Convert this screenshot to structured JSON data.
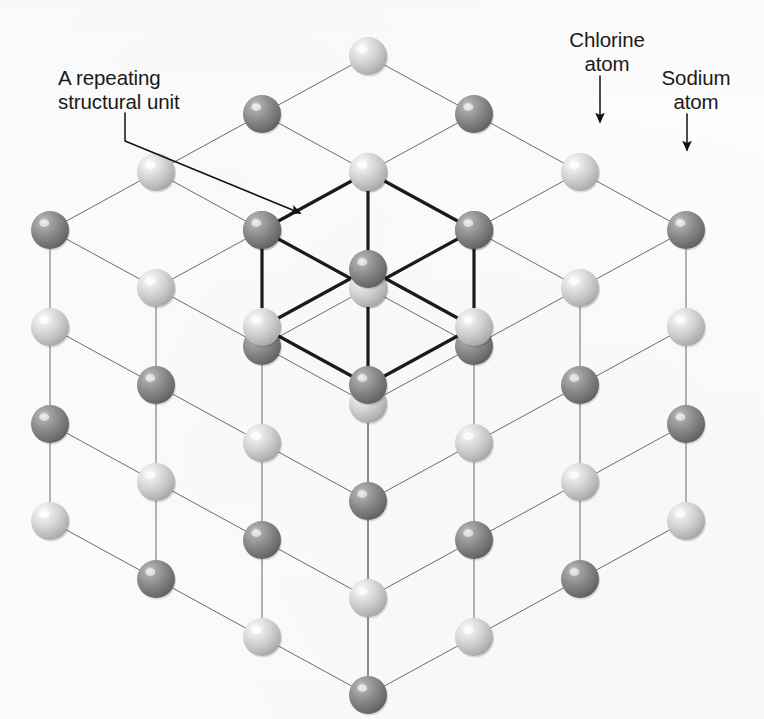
{
  "figure": {
    "background_color": "#fcfcfc"
  },
  "labels": {
    "repeating_unit": "A repeating\nstructural unit",
    "chlorine": "Chlorine\natom",
    "sodium": "Sodium\natom"
  },
  "legend": {
    "chlorine_color": "#c9c9c9",
    "sodium_color": "#7d7d7d",
    "lattice_line_color": "#6b6b6b",
    "unit_cell_line_color": "#1a1a1a",
    "text_color": "#1a1a1a"
  },
  "structure": {
    "type": "face-centered cubic rock-salt lattice",
    "grid_dimensions": "3 x 3 x 3",
    "atoms_per_edge": 4,
    "sphere_radius_px": 19,
    "atom_types": [
      "chlorine",
      "sodium"
    ],
    "alternation": "checkerboard",
    "projection": "isometric",
    "origin_px": [
      368,
      56
    ],
    "axis_u_px": [
      106,
      58
    ],
    "axis_v_px": [
      -106,
      58
    ],
    "axis_w_px": [
      0,
      97
    ],
    "highlighted_unit_cell": {
      "origin_cell": [
        1,
        1,
        0
      ],
      "size": 1,
      "line_width_px": 3.2
    }
  },
  "annotations": [
    {
      "name": "repeating-unit-leader",
      "label_key": "repeating_unit",
      "path": "M125,113 L125,141 L300,213",
      "arrow_at": [
        305,
        215
      ],
      "arrow_angle_deg": 22
    },
    {
      "name": "chlorine-leader",
      "label_key": "chlorine",
      "path": "M600,76 L600,122",
      "arrow_at": [
        600,
        130
      ],
      "arrow_angle_deg": 90
    },
    {
      "name": "sodium-leader",
      "label_key": "sodium",
      "path": "M687,114 L687,150",
      "arrow_at": [
        687,
        158
      ],
      "arrow_angle_deg": 90
    }
  ]
}
